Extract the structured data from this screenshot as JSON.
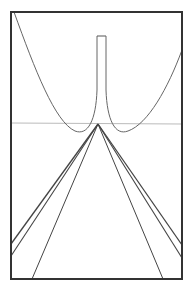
{
  "figure": {
    "width": 192,
    "height": 296,
    "background": "#ffffff",
    "frame": {
      "x": 11,
      "y": 12,
      "width": 171,
      "height": 267,
      "color": "#333333",
      "stroke_width": 2
    },
    "horizontal_line": {
      "x1": 11,
      "y1": 123,
      "x2": 182,
      "y2": 124,
      "color": "#bbbbbb"
    },
    "spike_top": {
      "x1": 97,
      "x2": 106,
      "y": 36,
      "color": "#555555"
    },
    "apex": {
      "x": 98,
      "y": 124
    },
    "curve_color": "#666666",
    "line_color": "#444444",
    "lines_from_apex": [
      {
        "to": [
          11,
          244
        ],
        "weight": 1.3
      },
      {
        "to": [
          11,
          256
        ],
        "weight": 1.1
      },
      {
        "to": [
          32,
          279
        ],
        "weight": 1.0
      },
      {
        "to": [
          182,
          245
        ],
        "weight": 1.3
      },
      {
        "to": [
          182,
          258
        ],
        "weight": 1.1
      },
      {
        "to": [
          163,
          279
        ],
        "weight": 1.0
      }
    ]
  }
}
